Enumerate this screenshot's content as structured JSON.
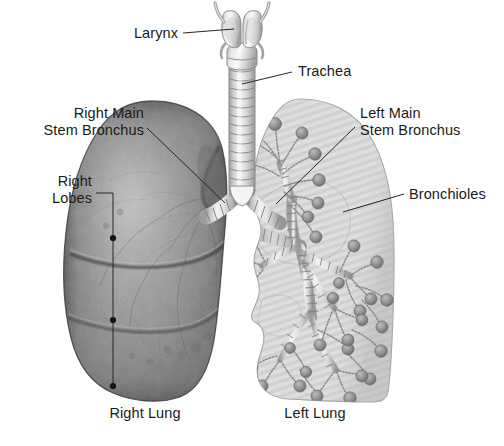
{
  "figure": {
    "type": "anatomical-illustration",
    "width": 504,
    "height": 446,
    "background_color": "#ffffff"
  },
  "labels": {
    "larynx": "Larynx",
    "trachea": "Trachea",
    "right_main_stem_bronchus_line1": "Right Main",
    "right_main_stem_bronchus_line2": "Stem Bronchus",
    "left_main_stem_bronchus_line1": "Left Main",
    "left_main_stem_bronchus_line2": "Stem Bronchus",
    "right_lobes_line1": "Right",
    "right_lobes_line2": "Lobes",
    "bronchioles": "Bronchioles",
    "right_lung": "Right Lung",
    "left_lung": "Left Lung"
  },
  "colors": {
    "text": "#1a1a1a",
    "leader_line": "#262626",
    "right_lung_fill": "#8c8c8c",
    "right_lung_shadow": "#4a4a4a",
    "right_lung_highlight": "#b4b4b4",
    "left_lung_fill": "#dcdcdc",
    "left_lung_stripe": "#cfcfcf",
    "left_lung_outline": "#9a9a9a",
    "airway_fill": "#e8e8e8",
    "airway_outline": "#8f8f8f",
    "bronchiole_node": "#8e8e8e",
    "lobe_marker": "#141414"
  },
  "structures": {
    "larynx": {
      "name": "larynx",
      "rings": 2
    },
    "trachea": {
      "name": "trachea",
      "cartilage_rings": 14
    },
    "right_lung": {
      "name": "right-lung",
      "lobes": 3,
      "lobe_markers": 3,
      "rendering": "photographic-gray"
    },
    "left_lung": {
      "name": "left-lung",
      "lobes": 2,
      "rendering": "hatched-light-gray-with-bronchial-tree"
    },
    "bronchial_tree": {
      "name": "bronchial-tree",
      "terminal_alveolar_sacs": 58
    }
  }
}
